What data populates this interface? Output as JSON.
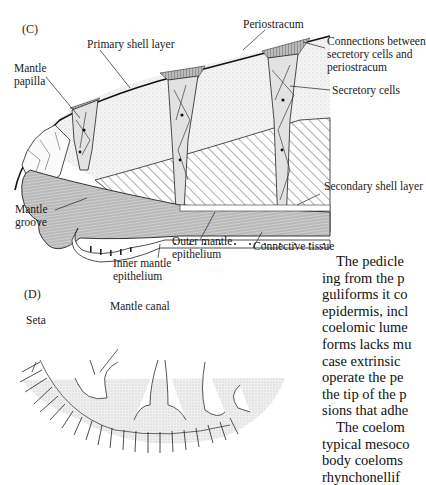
{
  "figure": {
    "panel_c": {
      "label": "(C)",
      "labels": {
        "periostracum": "Periostracum",
        "primary_shell_layer": "Primary shell layer",
        "connections": [
          "Connections between",
          "secretory cells and",
          "periostracum"
        ],
        "mantle_papilla": [
          "Mantle",
          "papilla"
        ],
        "secretory_cells": "Secretory cells",
        "secondary_shell_layer": "Secondary shell layer",
        "mantle_groove": [
          "Mantle",
          "groove"
        ],
        "outer_mantle_epithelium": [
          "Outer mantle",
          "epithelium"
        ],
        "connective_tissue": "Connective tissue",
        "inner_mantle_epithelium": [
          "Inner mantle",
          "epithelium"
        ]
      }
    },
    "panel_d": {
      "label": "(D)",
      "labels": {
        "mantle_canal": "Mantle canal",
        "seta": "Seta"
      }
    }
  },
  "body_text": {
    "lines": [
      "The pedicle",
      "ing from the p",
      "guliforms it co",
      "epidermis, incl",
      "coelomic lume",
      "forms lacks mu",
      "case extrinsic",
      "operate the pe",
      "the tip of the p",
      "sions that adhe",
      "The coelom",
      "typical mesoco",
      "body coeloms",
      "rhynchonellif"
    ]
  }
}
